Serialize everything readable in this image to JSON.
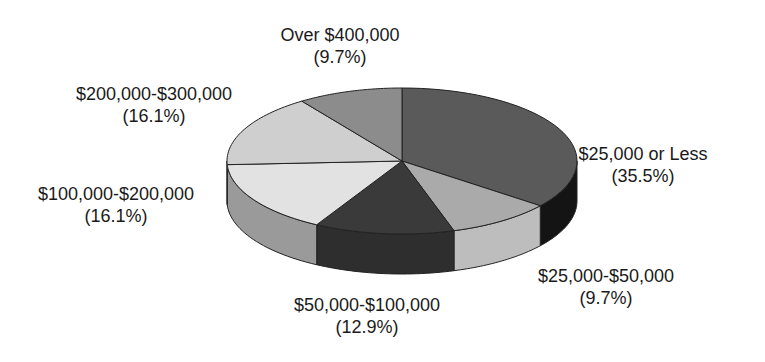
{
  "chart_data": {
    "type": "pie",
    "style": "3d",
    "title": "",
    "categories": [
      "$25,000 or Less",
      "$25,000-$50,000",
      "$50,000-$100,000",
      "$100,000-$200,000",
      "$200,000-$300,000",
      "Over $400,000"
    ],
    "values": [
      35.5,
      9.7,
      12.9,
      16.1,
      16.1,
      9.7
    ],
    "value_labels": [
      "(35.5%)",
      "(9.7%)",
      "(12.9%)",
      "(16.1%)",
      "(16.1%)",
      "(9.7%)"
    ],
    "unit": "%",
    "start_angle_deg": 0,
    "direction": "clockwise",
    "colors_top": [
      "#5a5a5a",
      "#aaaaaa",
      "#3a3a3a",
      "#e2e2e2",
      "#cfcfcf",
      "#8c8c8c"
    ],
    "colors_side": [
      "#141414",
      "#bdbdbd",
      "#2e2e2e",
      "#9a9a9a",
      "#9a9a9a",
      "#777777"
    ],
    "legend": "none",
    "labels_position": "outside"
  },
  "labels": [
    {
      "name": "$25,000 or Less",
      "pct": "(35.5%)",
      "x": 643,
      "y": 143
    },
    {
      "name": "$25,000-$50,000",
      "pct": "(9.7%)",
      "x": 606,
      "y": 265
    },
    {
      "name": "$50,000-$100,000",
      "pct": "(12.9%)",
      "x": 367,
      "y": 294
    },
    {
      "name": "$100,000-$200,000",
      "pct": "(16.1%)",
      "x": 116,
      "y": 183
    },
    {
      "name": "$200,000-$300,000",
      "pct": "(16.1%)",
      "x": 154,
      "y": 83
    },
    {
      "name": "Over $400,000",
      "pct": "(9.7%)",
      "x": 340,
      "y": 24
    }
  ]
}
